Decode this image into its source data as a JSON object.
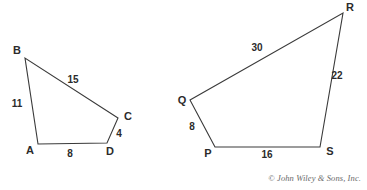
{
  "figure": {
    "background_color": "#ffffff",
    "line_color": "#3a3a3a",
    "label_color": "#2b2b2b",
    "credit": "© John Wiley & Sons, Inc."
  },
  "shapes": [
    {
      "name": "quadrilateral-abcd",
      "vertices": [
        {
          "label": "A",
          "x": 38,
          "y": 144,
          "label_x": 30,
          "label_y": 151
        },
        {
          "label": "B",
          "x": 25,
          "y": 58,
          "label_x": 17,
          "label_y": 51
        },
        {
          "label": "C",
          "x": 118,
          "y": 118,
          "label_x": 128,
          "label_y": 117
        },
        {
          "label": "D",
          "x": 107,
          "y": 143,
          "label_x": 110,
          "label_y": 152
        }
      ],
      "sides": [
        {
          "from": "A",
          "to": "B",
          "length": "11",
          "label_x": 17,
          "label_y": 104
        },
        {
          "from": "B",
          "to": "C",
          "length": "15",
          "label_x": 73,
          "label_y": 80
        },
        {
          "from": "C",
          "to": "D",
          "length": "4",
          "label_x": 119,
          "label_y": 134
        },
        {
          "from": "D",
          "to": "A",
          "length": "8",
          "label_x": 70,
          "label_y": 154
        }
      ]
    },
    {
      "name": "quadrilateral-pqrs",
      "vertices": [
        {
          "label": "P",
          "x": 215,
          "y": 147,
          "label_x": 208,
          "label_y": 154
        },
        {
          "label": "Q",
          "x": 190,
          "y": 100,
          "label_x": 182,
          "label_y": 101
        },
        {
          "label": "R",
          "x": 343,
          "y": 13,
          "label_x": 350,
          "label_y": 8
        },
        {
          "label": "S",
          "x": 320,
          "y": 147,
          "label_x": 330,
          "label_y": 152
        }
      ],
      "sides": [
        {
          "from": "P",
          "to": "Q",
          "length": "8",
          "label_x": 192,
          "label_y": 127
        },
        {
          "from": "Q",
          "to": "R",
          "length": "30",
          "label_x": 257,
          "label_y": 48
        },
        {
          "from": "R",
          "to": "S",
          "length": "22",
          "label_x": 337,
          "label_y": 76
        },
        {
          "from": "S",
          "to": "P",
          "length": "16",
          "label_x": 267,
          "label_y": 155
        }
      ]
    }
  ]
}
